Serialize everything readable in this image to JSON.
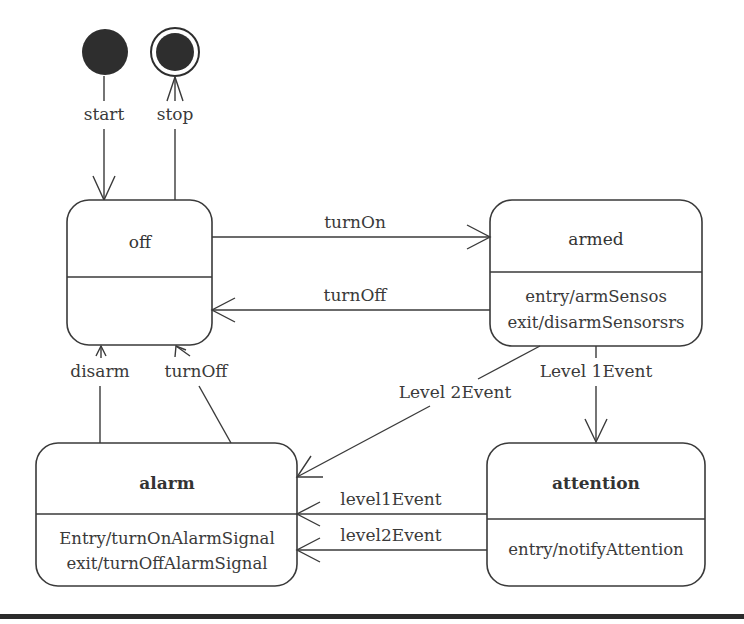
{
  "diagram": {
    "type": "UML state machine",
    "pseudostates": {
      "initial": {
        "label": "start"
      },
      "final": {
        "label": "stop"
      }
    },
    "states": {
      "off": {
        "name": "off",
        "bold": false,
        "actions": []
      },
      "armed": {
        "name": "armed",
        "bold": false,
        "actions": [
          "entry/armSensos",
          "exit/disarmSensorsrs"
        ]
      },
      "alarm": {
        "name": "alarm",
        "bold": true,
        "actions": [
          "Entry/turnOnAlarmSignal",
          "exit/turnOffAlarmSignal"
        ]
      },
      "attention": {
        "name": "attention",
        "bold": true,
        "actions": [
          "entry/notifyAttention"
        ]
      }
    },
    "transitions": {
      "start_to_off": {
        "from": "start",
        "to": "off",
        "label": "start"
      },
      "off_to_stop": {
        "from": "off",
        "to": "stop",
        "label": "stop"
      },
      "off_to_armed": {
        "from": "off",
        "to": "armed",
        "label": "turnOn"
      },
      "armed_to_off": {
        "from": "armed",
        "to": "off",
        "label": "turnOff"
      },
      "alarm_to_off_disarm": {
        "from": "alarm",
        "to": "off",
        "label": "disarm"
      },
      "alarm_to_off_turnoff": {
        "from": "alarm",
        "to": "off",
        "label": "turnOff"
      },
      "armed_to_alarm": {
        "from": "armed",
        "to": "alarm",
        "label": "Level 2Event"
      },
      "armed_to_attention": {
        "from": "armed",
        "to": "attention",
        "label": "Level 1Event"
      },
      "attention_to_alarm_l1": {
        "from": "attention",
        "to": "alarm",
        "label": "level1Event"
      },
      "attention_to_alarm_l2": {
        "from": "attention",
        "to": "alarm",
        "label": "level2Event"
      }
    }
  },
  "colors": {
    "stroke": "#3a3a3a",
    "fill": "#ffffff",
    "pseudostate_fill": "#2e2e2e",
    "rule": "#2b2b2b"
  }
}
